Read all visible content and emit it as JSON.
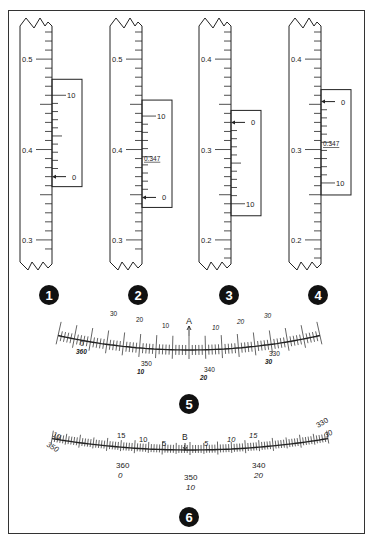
{
  "figure": {
    "ink_color": "#222222",
    "background": "#ffffff"
  },
  "linear_verniers": [
    {
      "number": "1",
      "cx": 50,
      "main_labels": [
        {
          "text": "0.5",
          "value": 0.5
        },
        {
          "text": "0.4",
          "value": 0.4
        },
        {
          "text": "0.3",
          "value": 0.3
        }
      ],
      "main_range": [
        0.28,
        0.53
      ],
      "vernier_labels": [
        {
          "text": "10",
          "value": 10
        },
        {
          "text": "0",
          "value": 0
        }
      ],
      "vernier_zero_value": 0.37,
      "vernier_direction": "up",
      "reading_label": "",
      "arrow_at": "0"
    },
    {
      "number": "2",
      "cx": 140,
      "main_labels": [
        {
          "text": "0.5",
          "value": 0.5
        },
        {
          "text": "0.4",
          "value": 0.4
        },
        {
          "text": "0.3",
          "value": 0.3
        }
      ],
      "main_range": [
        0.28,
        0.53
      ],
      "vernier_labels": [
        {
          "text": "10",
          "value": 10
        },
        {
          "text": "0",
          "value": 0
        }
      ],
      "vernier_zero_value": 0.347,
      "vernier_direction": "up",
      "reading_label": "0.347",
      "arrow_at": "0"
    },
    {
      "number": "3",
      "cx": 229,
      "main_labels": [
        {
          "text": "0.4",
          "value": 0.4
        },
        {
          "text": "0.3",
          "value": 0.3
        },
        {
          "text": "0.2",
          "value": 0.2
        }
      ],
      "main_range": [
        0.18,
        0.43
      ],
      "vernier_labels": [
        {
          "text": "0",
          "value": 0
        },
        {
          "text": "10",
          "value": 10
        }
      ],
      "vernier_zero_value": 0.33,
      "vernier_direction": "down",
      "reading_label": "",
      "arrow_at": "0"
    },
    {
      "number": "4",
      "cx": 319,
      "main_labels": [
        {
          "text": "0.4",
          "value": 0.4
        },
        {
          "text": "0.3",
          "value": 0.3
        },
        {
          "text": "0.2",
          "value": 0.2
        }
      ],
      "main_range": [
        0.18,
        0.43
      ],
      "vernier_labels": [
        {
          "text": "0",
          "value": 0
        },
        {
          "text": "10",
          "value": 10
        }
      ],
      "vernier_zero_value": 0.353,
      "vernier_direction": "down",
      "reading_label": "0.347",
      "arrow_at": "0"
    }
  ],
  "arc_verniers": [
    {
      "number": "5",
      "index_label": "A",
      "upper_labels": [
        "30",
        "20",
        "10",
        "10",
        "20",
        "30"
      ],
      "lower_labels": [
        {
          "top": "0",
          "bottom": "360"
        },
        {
          "top": "350",
          "bottom": "10"
        },
        {
          "top": "340",
          "bottom": "20"
        },
        {
          "top": "330",
          "bottom": "30"
        }
      ]
    },
    {
      "number": "6",
      "index_label": "B",
      "upper_labels": [
        "15",
        "10",
        "5",
        "5",
        "10",
        "15"
      ],
      "end_labels": [
        {
          "top": "10",
          "bottom": "350"
        },
        {
          "top": "330",
          "bottom": "30"
        }
      ],
      "lower_labels": [
        {
          "top": "360",
          "bottom": "0"
        },
        {
          "top": "350",
          "bottom": "10"
        },
        {
          "top": "340",
          "bottom": "20"
        }
      ]
    }
  ],
  "badges": [
    "1",
    "2",
    "3",
    "4",
    "5",
    "6"
  ]
}
